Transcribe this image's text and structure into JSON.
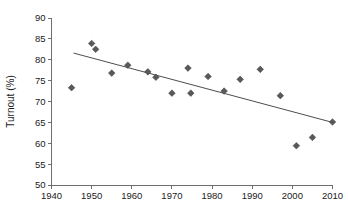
{
  "chart_data": {
    "type": "scatter",
    "title": "",
    "xlabel": "",
    "ylabel": "Turnout (%)",
    "xlim": [
      1940,
      2010
    ],
    "ylim": [
      50,
      90
    ],
    "xticks": [
      1940,
      1950,
      1960,
      1970,
      1980,
      1990,
      2000,
      2010
    ],
    "xtick_labels": [
      "1940",
      "1950",
      "1960",
      "1970",
      "1980",
      "1990",
      "2000",
      "2010"
    ],
    "yticks": [
      50,
      55,
      60,
      65,
      70,
      75,
      80,
      85,
      90
    ],
    "ytick_labels": [
      "50",
      "55",
      "60",
      "65",
      "70",
      "75",
      "80",
      "85",
      "90"
    ],
    "grid": false,
    "legend": false,
    "marker_shape": "diamond",
    "marker_color": "#595959",
    "trend_color": "#4d4d4d",
    "axis_color": "#6e6e6e",
    "x": [
      1945,
      1950,
      1951,
      1955,
      1959,
      1964,
      1966,
      1970,
      1974,
      1974.7,
      1979,
      1983,
      1987,
      1992,
      1997,
      2001,
      2005,
      2010
    ],
    "y": [
      73.3,
      83.9,
      82.5,
      76.8,
      78.7,
      77.1,
      75.8,
      72.0,
      78.0,
      72.0,
      76.0,
      72.5,
      75.3,
      77.7,
      71.4,
      59.4,
      61.4,
      65.1
    ],
    "points": [
      {
        "x": 1945,
        "y": 73.3
      },
      {
        "x": 1950,
        "y": 83.9
      },
      {
        "x": 1951,
        "y": 82.5
      },
      {
        "x": 1955,
        "y": 76.8
      },
      {
        "x": 1959,
        "y": 78.7
      },
      {
        "x": 1964,
        "y": 77.1
      },
      {
        "x": 1966,
        "y": 75.8
      },
      {
        "x": 1970,
        "y": 72.0
      },
      {
        "x": 1974,
        "y": 78.0
      },
      {
        "x": 1974.7,
        "y": 72.0
      },
      {
        "x": 1979,
        "y": 76.0
      },
      {
        "x": 1983,
        "y": 72.5
      },
      {
        "x": 1987,
        "y": 75.3
      },
      {
        "x": 1992,
        "y": 77.7
      },
      {
        "x": 1997,
        "y": 71.4
      },
      {
        "x": 2001,
        "y": 59.4
      },
      {
        "x": 2005,
        "y": 61.4
      },
      {
        "x": 2010,
        "y": 65.1
      }
    ],
    "trend": {
      "x0": 1945.5,
      "y0": 81.6,
      "x1": 2010.0,
      "y1": 65.0
    }
  }
}
